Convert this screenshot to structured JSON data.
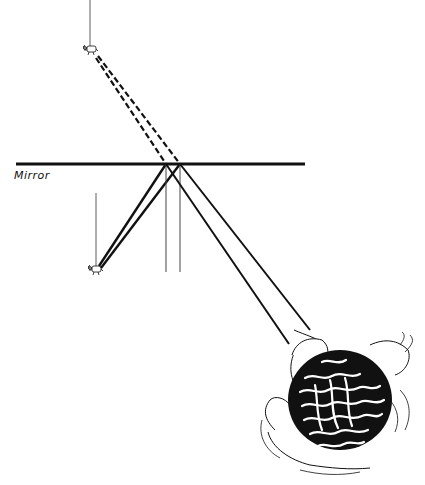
{
  "diagram": {
    "title": "",
    "labels": {
      "mirror": "Mirror"
    },
    "elements": {
      "mirror_line": {
        "x1": 16,
        "y1": 164,
        "x2": 305,
        "y2": 164
      },
      "object_real": {
        "description": "small hanging object (real)",
        "string": {
          "x": 96,
          "y1": 193,
          "y2": 266
        },
        "pos": {
          "x": 95,
          "y": 270
        }
      },
      "object_virtual": {
        "description": "small hanging object (virtual image)",
        "string": {
          "x": 90,
          "y1": 0,
          "y2": 46
        },
        "pos": {
          "x": 89,
          "y": 50
        }
      },
      "normals": [
        {
          "x": 166,
          "y1": 164,
          "y2": 272
        },
        {
          "x": 180,
          "y1": 164,
          "y2": 272
        }
      ],
      "incident_rays": [
        {
          "x1": 99,
          "y1": 266,
          "x2": 166,
          "y2": 164
        },
        {
          "x1": 101,
          "y1": 268,
          "x2": 180,
          "y2": 164
        }
      ],
      "reflected_rays": [
        {
          "x1": 166,
          "y1": 164,
          "x2": 289,
          "y2": 344
        },
        {
          "x1": 180,
          "y1": 164,
          "x2": 310,
          "y2": 330
        }
      ],
      "virtual_rays_dashed": [
        {
          "x1": 96,
          "y1": 58,
          "x2": 166,
          "y2": 164
        },
        {
          "x1": 98,
          "y1": 56,
          "x2": 180,
          "y2": 164
        }
      ],
      "observer": {
        "description": "observer's head viewed from above",
        "center": {
          "x": 340,
          "y": 400
        }
      }
    },
    "colors": {
      "ink": "#111111",
      "background": "#ffffff"
    }
  }
}
